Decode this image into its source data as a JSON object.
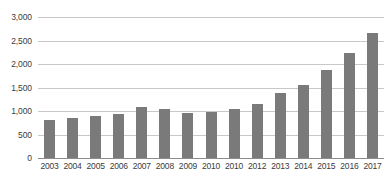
{
  "chart_data": {
    "type": "bar",
    "title": "",
    "subtitle": "",
    "xlabel": "",
    "ylabel": "",
    "categories": [
      "2003",
      "2004",
      "2005",
      "2006",
      "2007",
      "2008",
      "2009",
      "2010",
      "2010",
      "2012",
      "2013",
      "2014",
      "2015",
      "2016",
      "2017"
    ],
    "values": [
      770,
      820,
      850,
      900,
      1040,
      990,
      920,
      930,
      1000,
      1100,
      1310,
      1470,
      1790,
      2120,
      2530
    ],
    "series": [
      {
        "name": "",
        "values": [
          770,
          820,
          850,
          900,
          1040,
          990,
          920,
          930,
          1000,
          1100,
          1310,
          1470,
          1790,
          2120,
          2530
        ]
      }
    ],
    "ylim": [
      0,
      3000
    ],
    "yticks": [
      0,
      500,
      1000,
      1500,
      2000,
      2500,
      3000
    ],
    "ytick_labels": [
      "0",
      "500",
      "1,000",
      "1,500",
      "2,000",
      "2,500",
      "3,000"
    ],
    "grid": true,
    "legend": false,
    "legend_position": "none",
    "bar_color": "#7a7a7a",
    "gridline_color": "#c8c8c8",
    "axis_color": "#8c8c8c",
    "text_color": "#3b3b3b",
    "background_color": "#ffffff"
  }
}
